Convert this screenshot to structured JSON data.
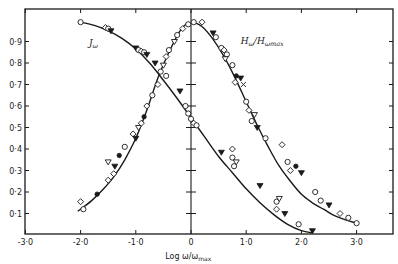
{
  "chart_data": {
    "type": "scatter",
    "title": "",
    "xlabel": "Log ω/ω_max",
    "ylabel": "",
    "xlim": [
      -3.0,
      3.5
    ],
    "ylim": [
      0,
      1.0
    ],
    "x_ticks": [
      {
        "value": -3.0,
        "label": "-3·0"
      },
      {
        "value": -2.0,
        "label": "-2·0"
      },
      {
        "value": -1.0,
        "label": "-1·0"
      },
      {
        "value": 0,
        "label": "0"
      },
      {
        "value": 1.0,
        "label": "1·0"
      },
      {
        "value": 2.0,
        "label": "2·0"
      },
      {
        "value": 3.0,
        "label": "3·0"
      }
    ],
    "y_ticks": [
      {
        "value": 0.1,
        "label": "0·1"
      },
      {
        "value": 0.2,
        "label": "0·2"
      },
      {
        "value": 0.3,
        "label": "0·3"
      },
      {
        "value": 0.4,
        "label": "0·4"
      },
      {
        "value": 0.5,
        "label": "0·5"
      },
      {
        "value": 0.6,
        "label": "0·6"
      },
      {
        "value": 0.7,
        "label": "0·7"
      },
      {
        "value": 0.8,
        "label": "0·8"
      },
      {
        "value": 0.9,
        "label": "0·9"
      }
    ],
    "grid": false,
    "legend": null,
    "annotations": [
      {
        "text": "J_ω",
        "x": -1.85,
        "y": 0.88
      },
      {
        "text": "H_ω/H_ωmax",
        "x": 0.9,
        "y": 0.89
      }
    ],
    "series": [
      {
        "name": "J_ω (falling)",
        "curve_x": [
          -2.0,
          -1.75,
          -1.5,
          -1.25,
          -1.0,
          -0.75,
          -0.5,
          -0.25,
          0.0,
          0.25,
          0.5,
          0.75,
          1.0,
          1.25,
          1.5,
          1.75,
          2.0,
          2.2
        ],
        "curve_y": [
          0.99,
          0.975,
          0.95,
          0.915,
          0.865,
          0.8,
          0.72,
          0.635,
          0.545,
          0.455,
          0.365,
          0.29,
          0.215,
          0.15,
          0.095,
          0.05,
          0.02,
          0.01
        ],
        "points": [
          {
            "x": -2.0,
            "y": 0.99,
            "m": "o"
          },
          {
            "x": -1.55,
            "y": 0.965,
            "m": "d"
          },
          {
            "x": -1.5,
            "y": 0.96,
            "m": "o"
          },
          {
            "x": -1.45,
            "y": 0.95,
            "m": "v"
          },
          {
            "x": -1.0,
            "y": 0.87,
            "m": "v"
          },
          {
            "x": -0.95,
            "y": 0.86,
            "m": "o"
          },
          {
            "x": -0.9,
            "y": 0.855,
            "m": "d"
          },
          {
            "x": -0.85,
            "y": 0.85,
            "m": "o"
          },
          {
            "x": -0.8,
            "y": 0.84,
            "m": "v"
          },
          {
            "x": -0.65,
            "y": 0.8,
            "m": "v"
          },
          {
            "x": -0.45,
            "y": 0.74,
            "m": "o"
          },
          {
            "x": -0.2,
            "y": 0.67,
            "m": "v"
          },
          {
            "x": -0.1,
            "y": 0.6,
            "m": "o"
          },
          {
            "x": -0.05,
            "y": 0.565,
            "m": "o"
          },
          {
            "x": 0.0,
            "y": 0.54,
            "m": "o"
          },
          {
            "x": 0.05,
            "y": 0.52,
            "m": "d"
          },
          {
            "x": 0.1,
            "y": 0.51,
            "m": "o"
          },
          {
            "x": 0.55,
            "y": 0.385,
            "m": "v"
          },
          {
            "x": 0.75,
            "y": 0.4,
            "m": "d"
          },
          {
            "x": 0.75,
            "y": 0.36,
            "m": "o"
          },
          {
            "x": 0.82,
            "y": 0.34,
            "m": "t"
          },
          {
            "x": 0.78,
            "y": 0.32,
            "m": "o"
          },
          {
            "x": 1.25,
            "y": 0.23,
            "m": "v"
          },
          {
            "x": 1.55,
            "y": 0.155,
            "m": "o"
          },
          {
            "x": 1.6,
            "y": 0.17,
            "m": "t"
          },
          {
            "x": 1.55,
            "y": 0.12,
            "m": "d"
          },
          {
            "x": 1.7,
            "y": 0.1,
            "m": "v"
          },
          {
            "x": 1.95,
            "y": 0.05,
            "m": "o"
          },
          {
            "x": 2.2,
            "y": 0.02,
            "m": "v"
          }
        ]
      },
      {
        "name": "J_ω (rising, left branch of H_ω/H_ωmax mirrored)",
        "curve_x": [
          -2.05,
          -1.8,
          -1.6,
          -1.4,
          -1.2,
          -1.0,
          -0.8,
          -0.6,
          -0.4,
          -0.2,
          -0.05
        ],
        "curve_y": [
          0.11,
          0.16,
          0.21,
          0.27,
          0.35,
          0.45,
          0.58,
          0.73,
          0.85,
          0.95,
          0.99
        ],
        "points": [
          {
            "x": -1.95,
            "y": 0.12,
            "m": "o"
          },
          {
            "x": -2.0,
            "y": 0.155,
            "m": "d"
          },
          {
            "x": -1.7,
            "y": 0.19,
            "m": "f"
          },
          {
            "x": -1.5,
            "y": 0.255,
            "m": "d"
          },
          {
            "x": -1.5,
            "y": 0.34,
            "m": "t"
          },
          {
            "x": -1.4,
            "y": 0.285,
            "m": "d"
          },
          {
            "x": -1.38,
            "y": 0.32,
            "m": "v"
          },
          {
            "x": -1.3,
            "y": 0.37,
            "m": "f"
          },
          {
            "x": -1.2,
            "y": 0.41,
            "m": "o"
          },
          {
            "x": -1.05,
            "y": 0.47,
            "m": "d"
          },
          {
            "x": -1.0,
            "y": 0.45,
            "m": "v"
          },
          {
            "x": -0.95,
            "y": 0.5,
            "m": "t"
          },
          {
            "x": -0.9,
            "y": 0.52,
            "m": "d"
          },
          {
            "x": -0.85,
            "y": 0.55,
            "m": "f"
          },
          {
            "x": -0.8,
            "y": 0.6,
            "m": "d"
          },
          {
            "x": -0.7,
            "y": 0.65,
            "m": "o"
          },
          {
            "x": -0.6,
            "y": 0.7,
            "m": "d"
          },
          {
            "x": -0.55,
            "y": 0.76,
            "m": "o"
          },
          {
            "x": -0.5,
            "y": 0.79,
            "m": "t"
          },
          {
            "x": -0.45,
            "y": 0.83,
            "m": "d"
          },
          {
            "x": -0.4,
            "y": 0.86,
            "m": "o"
          },
          {
            "x": -0.3,
            "y": 0.9,
            "m": "t"
          },
          {
            "x": -0.25,
            "y": 0.93,
            "m": "o"
          },
          {
            "x": -0.15,
            "y": 0.96,
            "m": "d"
          },
          {
            "x": -0.05,
            "y": 0.98,
            "m": "o"
          }
        ]
      },
      {
        "name": "H_ω/H_ωmax",
        "curve_x": [
          0.05,
          0.2,
          0.4,
          0.6,
          0.8,
          1.0,
          1.2,
          1.4,
          1.6,
          1.8,
          2.0,
          2.2,
          2.4,
          2.6,
          2.8,
          3.0
        ],
        "curve_y": [
          0.99,
          0.97,
          0.91,
          0.83,
          0.73,
          0.62,
          0.51,
          0.41,
          0.32,
          0.25,
          0.19,
          0.15,
          0.12,
          0.09,
          0.07,
          0.055
        ],
        "points": [
          {
            "x": 0.05,
            "y": 0.99,
            "m": "o"
          },
          {
            "x": 0.2,
            "y": 0.99,
            "m": "d"
          },
          {
            "x": 0.4,
            "y": 0.94,
            "m": "v"
          },
          {
            "x": 0.45,
            "y": 0.92,
            "m": "o"
          },
          {
            "x": 0.55,
            "y": 0.87,
            "m": "o"
          },
          {
            "x": 0.6,
            "y": 0.86,
            "m": "d"
          },
          {
            "x": 0.65,
            "y": 0.84,
            "m": "o"
          },
          {
            "x": 0.62,
            "y": 0.82,
            "m": "t"
          },
          {
            "x": 0.75,
            "y": 0.79,
            "m": "o"
          },
          {
            "x": 0.82,
            "y": 0.74,
            "m": "f"
          },
          {
            "x": 0.9,
            "y": 0.73,
            "m": "v"
          },
          {
            "x": 0.8,
            "y": 0.71,
            "m": "d"
          },
          {
            "x": 0.95,
            "y": 0.7,
            "m": "x"
          },
          {
            "x": 1.0,
            "y": 0.62,
            "m": "o"
          },
          {
            "x": 1.05,
            "y": 0.58,
            "m": "d"
          },
          {
            "x": 1.15,
            "y": 0.56,
            "m": "t"
          },
          {
            "x": 1.1,
            "y": 0.53,
            "m": "o"
          },
          {
            "x": 1.2,
            "y": 0.5,
            "m": "v"
          },
          {
            "x": 1.35,
            "y": 0.45,
            "m": "o"
          },
          {
            "x": 1.65,
            "y": 0.42,
            "m": "d"
          },
          {
            "x": 1.75,
            "y": 0.34,
            "m": "o"
          },
          {
            "x": 1.8,
            "y": 0.3,
            "m": "d"
          },
          {
            "x": 1.9,
            "y": 0.32,
            "m": "f"
          },
          {
            "x": 2.0,
            "y": 0.29,
            "m": "v"
          },
          {
            "x": 2.25,
            "y": 0.2,
            "m": "o"
          },
          {
            "x": 2.35,
            "y": 0.16,
            "m": "o"
          },
          {
            "x": 2.5,
            "y": 0.14,
            "m": "v"
          },
          {
            "x": 2.7,
            "y": 0.1,
            "m": "d"
          },
          {
            "x": 2.85,
            "y": 0.08,
            "m": "o"
          },
          {
            "x": 3.0,
            "y": 0.055,
            "m": "o"
          }
        ]
      }
    ]
  },
  "colors": {
    "ink": "#1a1a1a",
    "background": "#ffffff"
  },
  "layout": {
    "plot_left_px": 25,
    "plot_right_px": 393,
    "plot_top_px": 9,
    "plot_bottom_px": 234,
    "x0_px": 191,
    "px_per_x_unit": 55.2,
    "y0_px": 235,
    "px_per_y_unit": 215
  }
}
